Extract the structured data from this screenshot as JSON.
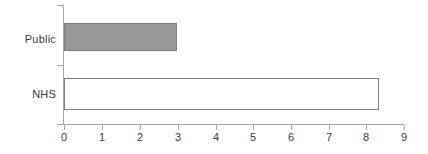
{
  "chart_data": {
    "type": "bar",
    "orientation": "horizontal",
    "title": "",
    "xlabel": "",
    "ylabel": "",
    "categories": [
      "Public",
      "NHS"
    ],
    "values": [
      3.0,
      8.35
    ],
    "series": [
      {
        "name": "",
        "values": [
          3.0,
          8.35
        ]
      }
    ],
    "bar_styles": [
      {
        "category": "Public",
        "fill": "#999999",
        "border": "#7d7d7d",
        "filled": true
      },
      {
        "category": "NHS",
        "fill": "#ffffff",
        "border": "#7d7d7d",
        "filled": false
      }
    ],
    "xlim": [
      0,
      9
    ],
    "ylim": null,
    "xticks": [
      0,
      1,
      2,
      3,
      4,
      5,
      6,
      7,
      8,
      9
    ],
    "xtick_labels": [
      "0",
      "1",
      "2",
      "3",
      "4",
      "5",
      "6",
      "7",
      "8",
      "9"
    ],
    "ytick_labels": [
      "Public",
      "NHS"
    ],
    "grid": false,
    "legend": false,
    "legend_position": "none",
    "annotations": []
  },
  "axis": {
    "x_ticks": [
      {
        "value": "0"
      },
      {
        "value": "1"
      },
      {
        "value": "2"
      },
      {
        "value": "3"
      },
      {
        "value": "4"
      },
      {
        "value": "5"
      },
      {
        "value": "6"
      },
      {
        "value": "7"
      },
      {
        "value": "8"
      },
      {
        "value": "9"
      }
    ]
  },
  "categories": [
    {
      "label": "Public"
    },
    {
      "label": "NHS"
    }
  ],
  "colors": {
    "bar_fill": "#999999",
    "bar_border": "#7d7d7d",
    "axis_line": "#a6a6a6",
    "text": "#3a3a3a",
    "background": "#ffffff"
  }
}
